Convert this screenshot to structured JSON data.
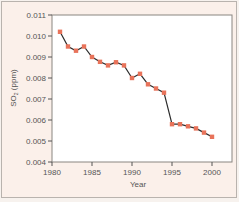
{
  "chart_data": {
    "type": "line",
    "title": "",
    "xlabel": "Year",
    "ylabel": "SO2 (ppm)",
    "ylabel_main": "SO",
    "ylabel_sub": "2",
    "ylabel_unit": " (ppm)",
    "xlim": [
      1980,
      2002.5
    ],
    "ylim": [
      0.004,
      0.011
    ],
    "x_ticks": [
      1980,
      1985,
      1990,
      1995,
      2000
    ],
    "x_tick_labels": [
      "1980",
      "1985",
      "1990",
      "1995",
      "2000"
    ],
    "y_ticks": [
      0.004,
      0.005,
      0.006,
      0.007,
      0.008,
      0.009,
      0.01,
      0.011
    ],
    "y_tick_labels": [
      "0.004",
      "0.005",
      "0.006",
      "0.007",
      "0.008",
      "0.009",
      "0.010",
      "0.011"
    ],
    "grid": false,
    "legend": null,
    "series": [
      {
        "name": "SO2",
        "line_color": "#2b2b2b",
        "marker_color": "#e8735a",
        "x": [
          1981,
          1982,
          1983,
          1984,
          1985,
          1986,
          1987,
          1988,
          1989,
          1990,
          1991,
          1992,
          1993,
          1994,
          1995,
          1996,
          1997,
          1998,
          1999,
          2000
        ],
        "values": [
          0.0102,
          0.0095,
          0.0093,
          0.0095,
          0.009,
          0.00877,
          0.0086,
          0.00875,
          0.0086,
          0.008,
          0.0082,
          0.0077,
          0.0075,
          0.0073,
          0.0058,
          0.0058,
          0.0057,
          0.0056,
          0.0054,
          0.0052
        ]
      }
    ]
  },
  "colors": {
    "panel_bg": "#fbf0ea",
    "plot_bg": "#ffffff",
    "frame": "#8a8580",
    "axis": "#555555"
  }
}
